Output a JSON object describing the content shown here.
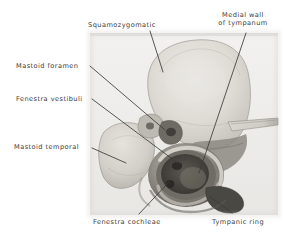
{
  "figure": {
    "kind": "anatomical-photograph",
    "background_color": "#ffffff",
    "photo_region": {
      "x": 90,
      "y": 33,
      "width": 188,
      "height": 182
    },
    "photo_base_color": "#e8e6e2",
    "ink_color": "#3b3b3b"
  },
  "labels": [
    {
      "id": "squamozygomatic",
      "text": "Squamozygomatic",
      "x": 88,
      "y": 21,
      "align": "left",
      "leader": {
        "x1": 150,
        "y1": 31,
        "x2": 163,
        "y2": 72
      }
    },
    {
      "id": "medial-wall-of-tympanum",
      "text_line1": "Medial wall",
      "text_line2": "of tympanum",
      "x": 216,
      "y": 11,
      "align": "center",
      "leader": {
        "x1": 246,
        "y1": 33,
        "x2": 199,
        "y2": 173
      }
    },
    {
      "id": "mastoid-foramen",
      "text": "Mastoid foramen",
      "x": 16,
      "y": 62,
      "align": "left",
      "leader": {
        "x1": 90,
        "y1": 66,
        "x2": 165,
        "y2": 130
      }
    },
    {
      "id": "fenestra-vestibuli",
      "text": "Fenestra vestibuli",
      "x": 16,
      "y": 95,
      "align": "left",
      "leader": {
        "x1": 92,
        "y1": 99,
        "x2": 179,
        "y2": 164
      }
    },
    {
      "id": "mastoid-temporal",
      "text": "Mastoid temporal",
      "x": 14,
      "y": 143,
      "align": "left",
      "leader": {
        "x1": 92,
        "y1": 148,
        "x2": 126,
        "y2": 163
      }
    },
    {
      "id": "fenestra-cochleae",
      "text": "Fenestra cochleae",
      "x": 93,
      "y": 218,
      "align": "left",
      "leader": {
        "x1": 139,
        "y1": 214,
        "x2": 169,
        "y2": 182
      }
    },
    {
      "id": "tympanic-ring",
      "text": "Tympanic ring",
      "x": 212,
      "y": 218,
      "align": "left",
      "leader": {
        "x1": 232,
        "y1": 213,
        "x2": 209,
        "y2": 196
      }
    }
  ]
}
